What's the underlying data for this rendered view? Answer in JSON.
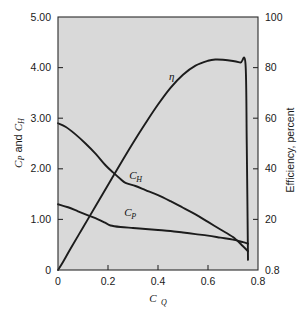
{
  "chart_data": {
    "type": "line",
    "title": "",
    "subtitle": "",
    "xlabel": "C_Q",
    "ylabel": "C_P and C_H",
    "ylabel_right": "Efficiency, percent",
    "xlim": [
      0,
      0.8
    ],
    "ylim": [
      0,
      5.0
    ],
    "ylim_right": [
      0,
      100
    ],
    "grid": false,
    "legend_position": "inline-annotations",
    "background_color": "#d9d9d9",
    "line_color": "#1c1c1c",
    "x_ticks": [
      "0",
      "0.2",
      "0.4",
      "0.6",
      "0.8"
    ],
    "x_tick_values": [
      0,
      0.2,
      0.4,
      0.6,
      0.8
    ],
    "y_ticks_left": [
      "0",
      "1.00",
      "2.00",
      "3.00",
      "4.00",
      "5.00"
    ],
    "y_tick_values_left": [
      0,
      1.0,
      2.0,
      3.0,
      4.0,
      5.0
    ],
    "y_ticks_right": [
      "0.8",
      "20",
      "40",
      "60",
      "80",
      "100"
    ],
    "y_tick_values_right": [
      0,
      20,
      40,
      60,
      80,
      100
    ],
    "series": [
      {
        "name": "eta",
        "label": "η",
        "axis": "right",
        "label_x": 0.455,
        "label_y": 75.0,
        "x": [
          0.0,
          0.02,
          0.05,
          0.1,
          0.15,
          0.2,
          0.25,
          0.3,
          0.35,
          0.4,
          0.45,
          0.5,
          0.55,
          0.6,
          0.63,
          0.66,
          0.7,
          0.73,
          0.75,
          0.755,
          0.76
        ],
        "values": [
          0.0,
          3.2,
          8.4,
          16.8,
          25.2,
          33.6,
          42.0,
          50.2,
          58.0,
          65.4,
          72.0,
          77.2,
          80.8,
          82.7,
          83.2,
          83.1,
          82.6,
          82.0,
          81.5,
          50.0,
          4.0
        ]
      },
      {
        "name": "C_H",
        "label": "C_H",
        "label_base": "C",
        "label_sub": "H",
        "axis": "left",
        "label_x": 0.285,
        "label_y": 1.8,
        "x": [
          0.0,
          0.03,
          0.07,
          0.11,
          0.15,
          0.19,
          0.22,
          0.25,
          0.27,
          0.31,
          0.35,
          0.4,
          0.45,
          0.5,
          0.55,
          0.6,
          0.65,
          0.7,
          0.74,
          0.76
        ],
        "values": [
          2.9,
          2.83,
          2.68,
          2.5,
          2.3,
          2.07,
          1.93,
          1.8,
          1.72,
          1.66,
          1.58,
          1.48,
          1.36,
          1.23,
          1.1,
          0.95,
          0.8,
          0.65,
          0.47,
          0.37
        ]
      },
      {
        "name": "C_P",
        "label": "C_P",
        "label_base": "C",
        "label_sub": "P",
        "axis": "left",
        "label_x": 0.265,
        "label_y": 1.06,
        "x": [
          0.0,
          0.04,
          0.08,
          0.12,
          0.16,
          0.19,
          0.21,
          0.25,
          0.3,
          0.35,
          0.4,
          0.45,
          0.5,
          0.55,
          0.6,
          0.65,
          0.7,
          0.74,
          0.76
        ],
        "values": [
          1.3,
          1.24,
          1.16,
          1.08,
          1.0,
          0.93,
          0.88,
          0.85,
          0.83,
          0.81,
          0.79,
          0.77,
          0.74,
          0.71,
          0.68,
          0.64,
          0.6,
          0.55,
          0.52
        ]
      }
    ]
  }
}
